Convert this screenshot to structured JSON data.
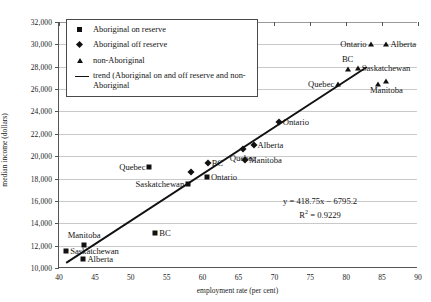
{
  "chart_data": {
    "type": "scatter",
    "title": "",
    "xlabel": "employment rate (per cent)",
    "ylabel": "median income (dollars)",
    "xlim": [
      40,
      90
    ],
    "ylim": [
      10000,
      32000
    ],
    "xticks": [
      40,
      45,
      50,
      55,
      60,
      65,
      70,
      75,
      80,
      85,
      90
    ],
    "yticks": [
      "10,000",
      "12,000",
      "14,000",
      "16,000",
      "18,000",
      "20,000",
      "22,000",
      "24,000",
      "26,000",
      "28,000",
      "30,000",
      "32,000"
    ],
    "ytick_values": [
      10000,
      12000,
      14000,
      16000,
      18000,
      20000,
      22000,
      24000,
      26000,
      28000,
      30000,
      32000
    ],
    "grid": true,
    "legend_position": "top-left",
    "series": [
      {
        "name": "Aboriginal on reserve",
        "marker": "square",
        "points": [
          {
            "label": "Saskatchewan",
            "x": 41.0,
            "y": 11500,
            "label_pos": "r"
          },
          {
            "label": "Alberta",
            "x": 43.4,
            "y": 10800,
            "label_pos": "r"
          },
          {
            "label": "Manitoba",
            "x": 43.5,
            "y": 12050,
            "label_pos": "t"
          },
          {
            "label": "BC",
            "x": 53.4,
            "y": 13150,
            "label_pos": "r"
          },
          {
            "label": "Quebec",
            "x": 52.6,
            "y": 19000,
            "label_pos": "l"
          },
          {
            "label": "Saskatchewan",
            "x": 58.0,
            "y": 17500,
            "label_pos": "l"
          },
          {
            "label": "Ontario",
            "x": 60.6,
            "y": 18100,
            "label_pos": "r"
          }
        ]
      },
      {
        "name": "Aboriginal off reserve",
        "marker": "diamond",
        "points": [
          {
            "label": "",
            "x": 58.4,
            "y": 18550,
            "label_pos": "r"
          },
          {
            "label": "BC",
            "x": 60.7,
            "y": 19350,
            "label_pos": "r"
          },
          {
            "label": "Manitoba",
            "x": 65.9,
            "y": 19700,
            "label_pos": "r"
          },
          {
            "label": "Alberta",
            "x": 67.1,
            "y": 21000,
            "label_pos": "r"
          },
          {
            "label": "Quebec",
            "x": 65.6,
            "y": 20650,
            "label_pos": "b"
          },
          {
            "label": "Ontario",
            "x": 70.6,
            "y": 23050,
            "label_pos": "r"
          }
        ]
      },
      {
        "name": "non-Aboriginal",
        "marker": "triangle",
        "points": [
          {
            "label": "Quebec",
            "x": 78.9,
            "y": 26500,
            "label_pos": "l"
          },
          {
            "label": "BC",
            "x": 80.2,
            "y": 27800,
            "label_pos": "t"
          },
          {
            "label": "Saskatchewan",
            "x": 81.6,
            "y": 27850,
            "label_pos": "r"
          },
          {
            "label": "",
            "x": 84.4,
            "y": 26450,
            "label_pos": "r"
          },
          {
            "label": "Manitoba",
            "x": 85.6,
            "y": 26750,
            "label_pos": "b"
          },
          {
            "label": "Ontario",
            "x": 83.4,
            "y": 30000,
            "label_pos": "l"
          },
          {
            "label": "Alberta",
            "x": 85.6,
            "y": 30000,
            "label_pos": "r"
          }
        ]
      }
    ],
    "trendline": {
      "slope": 418.75,
      "intercept": -6795.2,
      "r_squared": 0.9229,
      "equation": "y = 418.75x − 6795.2",
      "r2_prefix": "R",
      "r2_exp": "2",
      "r2_value": "= 0.9229",
      "x_start": 41.0,
      "x_end": 83.0
    }
  },
  "legend": {
    "items": [
      {
        "key": "square",
        "label": "Aboriginal on reserve"
      },
      {
        "key": "diamond",
        "label": "Aboriginal off reserve"
      },
      {
        "key": "triangle",
        "label": "non-Aboriginal"
      },
      {
        "key": "line",
        "label": "trend (Aboriginal on and off reserve and non-Aboriginal"
      }
    ]
  },
  "top_caption": ""
}
